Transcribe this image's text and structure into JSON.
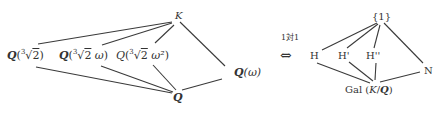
{
  "left_lattice": {
    "top": "K",
    "middle": [
      {
        "base": "Q",
        "open": "(",
        "index": "3",
        "radicand": "2",
        "extra": "",
        "close": ")"
      },
      {
        "base": "Q",
        "open": "(",
        "index": "3",
        "radicand": "2",
        "extra": " ω",
        "close": ")"
      },
      {
        "base": "Q",
        "open": "(",
        "index": "3",
        "radicand": "2",
        "extra": " ω²",
        "close": ")"
      }
    ],
    "right_field": {
      "base": "Q",
      "arg": "(ω)"
    },
    "bottom": "Q"
  },
  "correspondence": {
    "label": "1対1",
    "symbol": "⇔"
  },
  "right_lattice": {
    "top": "{1}",
    "middle": [
      "H",
      "H'",
      "H''"
    ],
    "right": "N",
    "bottom": {
      "prefix": "Gal (",
      "field": "K",
      "slash": "/",
      "base": "Q",
      "suffix": ")"
    }
  },
  "colors": {
    "line": "#3a3a3a",
    "text": "#333333",
    "background": "#ffffff"
  }
}
